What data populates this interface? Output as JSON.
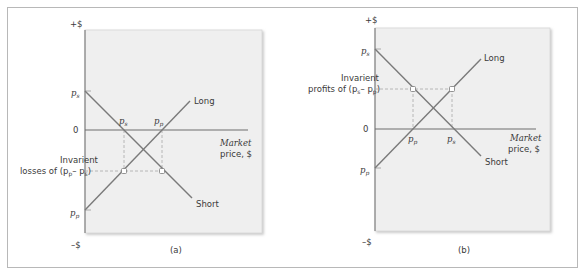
{
  "colors": {
    "plot_background": "#efefef",
    "plot_border": "#d0d0d0",
    "line": "#7a7a7a",
    "axis": "#6e6e6e",
    "dashed": "#a8a8a8",
    "text": "#3a3a3a"
  },
  "panels": [
    {
      "id": "a",
      "caption": "(a)",
      "y_axis_top_label": "+$",
      "y_axis_bottom_label": "–$",
      "zero_label": "0",
      "x_axis_label_line1": "Market",
      "x_axis_label_line2": "price, $",
      "y_label_ps": "p",
      "y_label_ps_sub": "s",
      "y_label_pp": "p",
      "y_label_pp_sub": "p",
      "point_label_1": "p",
      "point_label_1_sub": "s",
      "point_label_2": "p",
      "point_label_2_sub": "p",
      "annotation_line1": "Invarient",
      "annotation_line2": "losses of (p",
      "annotation_sub1": "p",
      "annotation_mid": "– p",
      "annotation_sub2": "s",
      "annotation_end": ")",
      "long_label": "Long",
      "short_label": "Short"
    },
    {
      "id": "b",
      "caption": "(b)",
      "y_axis_top_label": "+$",
      "y_axis_bottom_label": "–$",
      "zero_label": "0",
      "x_axis_label_line1": "Market",
      "x_axis_label_line2": "price, $",
      "y_label_ps": "p",
      "y_label_ps_sub": "s",
      "y_label_pp": "p",
      "y_label_pp_sub": "p",
      "point_label_1": "p",
      "point_label_1_sub": "p",
      "point_label_2": "p",
      "point_label_2_sub": "s",
      "annotation_line1": "Invarient",
      "annotation_line2": "profits of (p",
      "annotation_sub1": "s",
      "annotation_mid": "– p",
      "annotation_sub2": "p",
      "annotation_end": ")",
      "long_label": "Long",
      "short_label": "Short"
    }
  ]
}
